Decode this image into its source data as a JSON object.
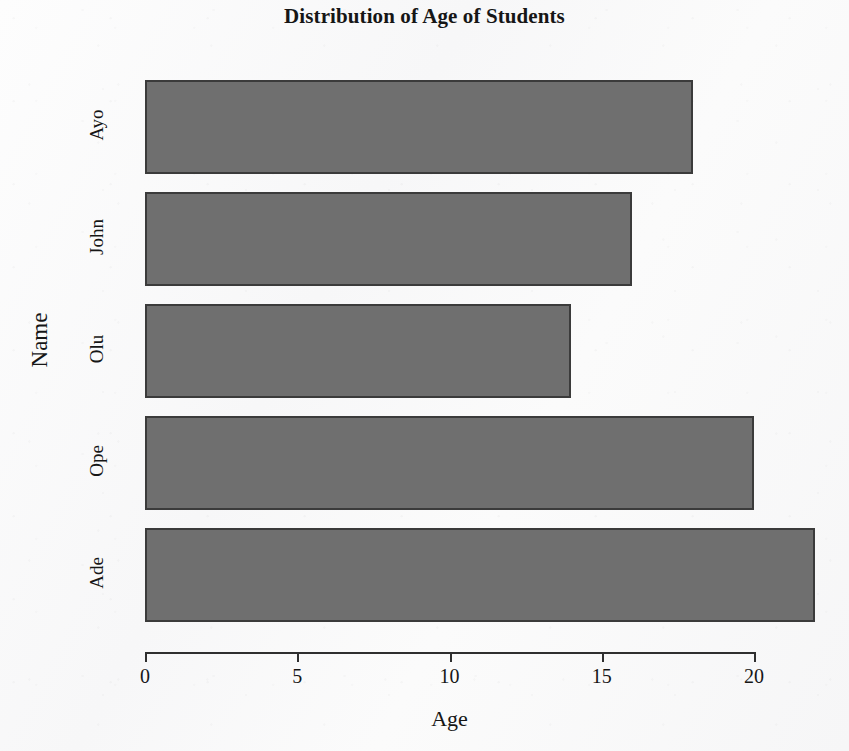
{
  "chart_data": {
    "type": "bar",
    "orientation": "horizontal",
    "title": "Distribution of Age of Students",
    "xlabel": "Age",
    "ylabel": "Name",
    "categories": [
      "Ayo",
      "John",
      "Olu",
      "Ope",
      "Ade"
    ],
    "values": [
      18,
      16,
      14,
      20,
      22
    ],
    "series": [
      {
        "name": "Age",
        "values": [
          18,
          16,
          14,
          20,
          22
        ]
      }
    ],
    "xticks": [
      0,
      5,
      10,
      15,
      20
    ],
    "xtick_labels": [
      "0",
      "5",
      "10",
      "15",
      "20"
    ],
    "xlim": [
      0,
      20
    ],
    "grid": false,
    "legend": false,
    "bar_fill_color": "#6f6f6f",
    "bar_edge_color": "#3b3b3b",
    "background_color": "#fbfbfc",
    "text_color": "#161616"
  }
}
